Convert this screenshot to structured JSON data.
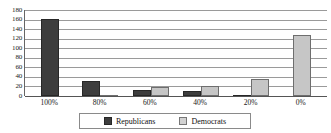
{
  "chart_data": {
    "type": "bar",
    "title": "",
    "subtitle": "",
    "xlabel": "",
    "ylabel": "",
    "categories": [
      "100%",
      "80%",
      "60%",
      "40%",
      "20%",
      "0%"
    ],
    "series": [
      {
        "name": "Republicans",
        "color": "#3d3d3d",
        "values": [
          162,
          31,
          13,
          11,
          2,
          0
        ]
      },
      {
        "name": "Democrats",
        "color": "#c6c6c6",
        "values": [
          0,
          3,
          18,
          21,
          36,
          128
        ]
      }
    ],
    "ylim": [
      0,
      180
    ],
    "ytick_step": 20,
    "yticks": [
      180,
      160,
      140,
      120,
      100,
      80,
      60,
      40,
      20,
      0
    ],
    "ytick_labels": [
      "180",
      "160",
      "140",
      "120",
      "100",
      "80",
      "60",
      "40",
      "20",
      "0"
    ],
    "grid": true,
    "grid_axis": "y",
    "legend": true,
    "legend_position": "bottom"
  },
  "legend": {
    "entries": [
      {
        "label": "Republicans",
        "swatch": "republicans-swatch"
      },
      {
        "label": "Democrats",
        "swatch": "democrats-swatch"
      }
    ]
  },
  "colors": {
    "republicans": "#3d3d3d",
    "democrats": "#c6c6c6",
    "gridline": "#9a9a9a",
    "axis": "#555555",
    "text": "#1a1a1a",
    "background": "#ffffff"
  }
}
